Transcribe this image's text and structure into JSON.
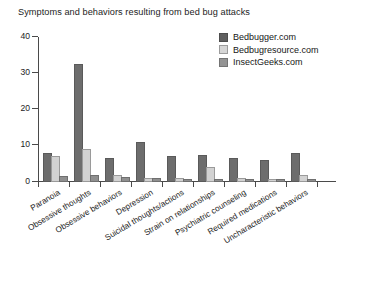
{
  "chart_data": {
    "type": "bar",
    "title": "Symptoms and behaviors resulting from bed bug attacks",
    "xlabel": "",
    "ylabel": "",
    "ylim": [
      0,
      40
    ],
    "yticks": [
      0,
      10,
      20,
      30,
      40
    ],
    "grid": false,
    "legend_position": "top-right",
    "categories": [
      "Paranoia",
      "Obsessive thoughts",
      "Obsessive behaviors",
      "Depression",
      "Suicidal thoughts/actions",
      "Strain on relationships",
      "Psychiatric counseling",
      "Required medications",
      "Uncharacteristic behaviors"
    ],
    "series": [
      {
        "name": "Bedbugger.com",
        "color": "#6d6d6d",
        "values": [
          7.5,
          32,
          6,
          10.5,
          6.5,
          7,
          6,
          5.5,
          7.5
        ]
      },
      {
        "name": "Bedbugresource.com",
        "color": "#d2d2d2",
        "values": [
          6.5,
          8.5,
          1.5,
          0.5,
          0.5,
          3.5,
          0.5,
          0.3,
          1.5
        ]
      },
      {
        "name": "InsectGeeks.com",
        "color": "#8f8f8f",
        "values": [
          1,
          1.5,
          0.8,
          0.5,
          0.3,
          0.4,
          0.3,
          0.2,
          0.2
        ]
      }
    ]
  },
  "axis": {
    "y_tick_labels": [
      "0",
      "10",
      "20",
      "30",
      "40"
    ]
  }
}
